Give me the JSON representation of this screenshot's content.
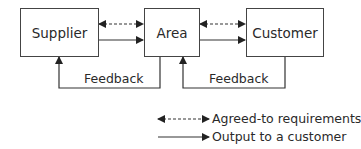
{
  "diagram": {
    "nodes": [
      {
        "id": "supplier",
        "label": "Supplier"
      },
      {
        "id": "area",
        "label": "Area"
      },
      {
        "id": "customer",
        "label": "Customer"
      }
    ],
    "edges": [
      {
        "from": "supplier",
        "to": "area",
        "style": "dashed-bidirectional"
      },
      {
        "from": "supplier",
        "to": "area",
        "style": "solid"
      },
      {
        "from": "area",
        "to": "customer",
        "style": "dashed-bidirectional"
      },
      {
        "from": "area",
        "to": "customer",
        "style": "solid"
      },
      {
        "from": "area",
        "to": "supplier",
        "style": "solid",
        "label": "Feedback"
      },
      {
        "from": "customer",
        "to": "area",
        "style": "solid",
        "label": "Feedback"
      }
    ],
    "feedback_labels": [
      "Feedback",
      "Feedback"
    ]
  },
  "legend": {
    "items": [
      {
        "style": "dashed-bidirectional",
        "label": "Agreed-to requirements"
      },
      {
        "style": "solid",
        "label": "Output to a customer"
      }
    ]
  },
  "colors": {
    "line": "#444444",
    "text": "#2a2a2a"
  }
}
